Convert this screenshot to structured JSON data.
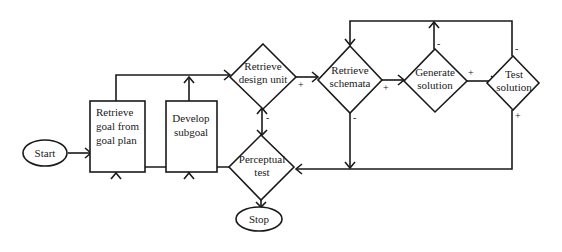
{
  "diagram": {
    "type": "flowchart",
    "nodes": {
      "start": {
        "label": "Start",
        "shape": "oval"
      },
      "retrieve_goal": {
        "shape": "rectangle",
        "lines": [
          "Retrieve",
          "goal from",
          "goal plan"
        ]
      },
      "develop_subgoal": {
        "shape": "rectangle",
        "lines": [
          "Develop",
          "subgoal"
        ]
      },
      "retrieve_design_unit": {
        "shape": "diamond",
        "lines": [
          "Retrieve",
          "design unit"
        ]
      },
      "retrieve_schemata": {
        "shape": "diamond",
        "lines": [
          "Retrieve",
          "schemata"
        ]
      },
      "generate_solution": {
        "shape": "diamond",
        "lines": [
          "Generate",
          "solution"
        ]
      },
      "test_solution": {
        "shape": "diamond",
        "lines": [
          "Test",
          "solution"
        ]
      },
      "perceptual_test": {
        "shape": "diamond",
        "lines": [
          "Perceptual",
          "test"
        ]
      },
      "stop": {
        "label": "Stop",
        "shape": "oval"
      }
    },
    "edge_labels": {
      "design_unit_plus": "+",
      "design_unit_minus": "-",
      "schemata_plus": "+",
      "schemata_minus": "-",
      "generate_plus": "+",
      "generate_minus": "-",
      "test_plus": "+",
      "test_minus": "-"
    },
    "edges": [
      {
        "from": "start",
        "to": "retrieve_goal"
      },
      {
        "from": "retrieve_goal",
        "to": "retrieve_design_unit"
      },
      {
        "from": "develop_subgoal",
        "to": "retrieve_design_unit"
      },
      {
        "from": "retrieve_design_unit",
        "to": "retrieve_schemata",
        "label": "+"
      },
      {
        "from": "retrieve_design_unit",
        "to": "perceptual_test",
        "label": "-"
      },
      {
        "from": "retrieve_schemata",
        "to": "generate_solution",
        "label": "+"
      },
      {
        "from": "retrieve_schemata",
        "to": "perceptual_test",
        "label": "-"
      },
      {
        "from": "generate_solution",
        "to": "test_solution",
        "label": "+"
      },
      {
        "from": "generate_solution",
        "to": "retrieve_schemata",
        "label": "-"
      },
      {
        "from": "test_solution",
        "to": "retrieve_schemata",
        "label": "-"
      },
      {
        "from": "test_solution",
        "to": "perceptual_test",
        "label": "+"
      },
      {
        "from": "perceptual_test",
        "to": "retrieve_goal"
      },
      {
        "from": "perceptual_test",
        "to": "develop_subgoal"
      },
      {
        "from": "perceptual_test",
        "to": "stop"
      }
    ]
  }
}
